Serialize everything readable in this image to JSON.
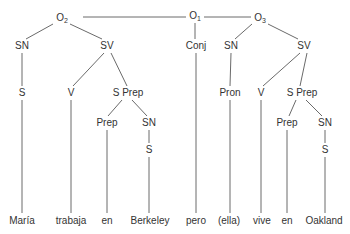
{
  "diagram": {
    "type": "syntax-tree",
    "root": "O1",
    "nodes": [
      {
        "id": "o1",
        "label": "O",
        "sub": "1",
        "x": 195,
        "y": 16
      },
      {
        "id": "o2",
        "label": "O",
        "sub": "2",
        "x": 62,
        "y": 18
      },
      {
        "id": "o3",
        "label": "O",
        "sub": "3",
        "x": 260,
        "y": 18
      },
      {
        "id": "sn1",
        "label": "SN",
        "x": 22,
        "y": 46
      },
      {
        "id": "sv1",
        "label": "SV",
        "x": 107,
        "y": 46
      },
      {
        "id": "conj",
        "label": "Conj",
        "x": 196,
        "y": 46
      },
      {
        "id": "sn2",
        "label": "SN",
        "x": 231,
        "y": 46
      },
      {
        "id": "sv2",
        "label": "SV",
        "x": 304,
        "y": 46
      },
      {
        "id": "s1",
        "label": "S",
        "x": 22,
        "y": 93
      },
      {
        "id": "v1",
        "label": "V",
        "x": 71,
        "y": 93
      },
      {
        "id": "sprep1",
        "label": "S Prep",
        "x": 128,
        "y": 93
      },
      {
        "id": "pron",
        "label": "Pron",
        "x": 230,
        "y": 93
      },
      {
        "id": "v2",
        "label": "V",
        "x": 261,
        "y": 93
      },
      {
        "id": "sprep2",
        "label": "S Prep",
        "x": 302,
        "y": 93
      },
      {
        "id": "prep1",
        "label": "Prep",
        "x": 107,
        "y": 123
      },
      {
        "id": "sn3",
        "label": "SN",
        "x": 149,
        "y": 123
      },
      {
        "id": "prep2",
        "label": "Prep",
        "x": 287,
        "y": 123
      },
      {
        "id": "sn4",
        "label": "SN",
        "x": 325,
        "y": 123
      },
      {
        "id": "s2",
        "label": "S",
        "x": 149,
        "y": 150
      },
      {
        "id": "s3",
        "label": "S",
        "x": 325,
        "y": 150
      },
      {
        "id": "w1",
        "label": "María",
        "x": 22,
        "y": 221
      },
      {
        "id": "w2",
        "label": "trabaja",
        "x": 71,
        "y": 221
      },
      {
        "id": "w3",
        "label": "en",
        "x": 107,
        "y": 221
      },
      {
        "id": "w4",
        "label": "Berkeley",
        "x": 150,
        "y": 221
      },
      {
        "id": "w5",
        "label": "pero",
        "x": 196,
        "y": 221
      },
      {
        "id": "w6",
        "label": "(ella)",
        "x": 229,
        "y": 221
      },
      {
        "id": "w7",
        "label": "vive",
        "x": 262,
        "y": 221
      },
      {
        "id": "w8",
        "label": "en",
        "x": 287,
        "y": 221
      },
      {
        "id": "w9",
        "label": "Oakland",
        "x": 324,
        "y": 221
      }
    ],
    "edges": [
      [
        83,
        17,
        186,
        17
      ],
      [
        204,
        17,
        251,
        17
      ],
      [
        195,
        23,
        195,
        39
      ],
      [
        53,
        24,
        26,
        39
      ],
      [
        70,
        24,
        102,
        39
      ],
      [
        252,
        24,
        235,
        39
      ],
      [
        268,
        24,
        298,
        39
      ],
      [
        22,
        53,
        22,
        86
      ],
      [
        104,
        53,
        73,
        86
      ],
      [
        111,
        53,
        127,
        86
      ],
      [
        231,
        53,
        230,
        86
      ],
      [
        300,
        53,
        263,
        86
      ],
      [
        307,
        53,
        300,
        86
      ],
      [
        122,
        100,
        108,
        116
      ],
      [
        132,
        100,
        147,
        116
      ],
      [
        296,
        100,
        289,
        116
      ],
      [
        306,
        100,
        322,
        116
      ],
      [
        149,
        130,
        149,
        143
      ],
      [
        325,
        130,
        325,
        143
      ],
      [
        22,
        100,
        22,
        213
      ],
      [
        71,
        100,
        71,
        213
      ],
      [
        107,
        130,
        107,
        213
      ],
      [
        149,
        157,
        149,
        213
      ],
      [
        196,
        53,
        196,
        213
      ],
      [
        230,
        100,
        230,
        213
      ],
      [
        261,
        100,
        261,
        213
      ],
      [
        287,
        130,
        287,
        213
      ],
      [
        325,
        157,
        325,
        213
      ]
    ],
    "line_color": "#6a6a6a",
    "text_color": "#333333"
  }
}
